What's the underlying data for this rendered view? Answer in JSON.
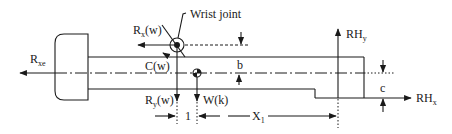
{
  "diagram": {
    "type": "free-body diagram",
    "labels": {
      "wrist_joint": "Wrist joint",
      "rx_w": "R",
      "rx_w_sub": "x",
      "rx_w_suffix": "(w)",
      "rxe": "R",
      "rxe_sub": "xe",
      "c_w": "C(w)",
      "b": "b",
      "ry_w": "R",
      "ry_w_sub": "y",
      "ry_w_suffix": "(w)",
      "w_k": "W(k)",
      "one": "1",
      "x1": "X",
      "x1_sub": "1",
      "rhy": "RH",
      "rhy_sub": "y",
      "rhx": "RH",
      "rhx_sub": "x",
      "c": "c"
    },
    "colors": {
      "stroke": "#1a1a1a",
      "background": "#ffffff"
    }
  }
}
